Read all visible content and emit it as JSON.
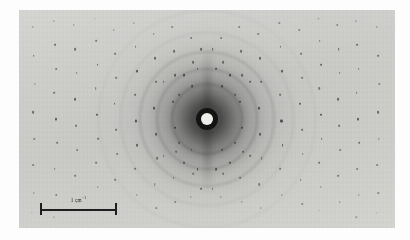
{
  "figure": {
    "kind": "x-ray-fiber-diffraction-photograph",
    "caption": "",
    "plate": {
      "x": 19,
      "y": 10,
      "width": 376,
      "height": 218
    },
    "page_background": "#fdfdfd",
    "emulsion_background": "#e3e3e1",
    "spot_color": "#2a2a2a",
    "halo_color": "#191919"
  },
  "beamstop": {
    "label": "beamstop",
    "center_x_pct": 50,
    "center_y_pct": 50,
    "disc_color": "#efefe9",
    "shadow_color": "#141414",
    "disc_diameter_px": 12,
    "shadow_diameter_px": 22
  },
  "scale_bar": {
    "label_text": "1 cm",
    "label_exponent": "−1",
    "x": 40,
    "y": 203,
    "length_px": 77,
    "color": "#1e1e1e",
    "tick_height_px": 12
  },
  "rings": [
    {
      "r": 34,
      "opacity": 0.26,
      "width": 2.4
    },
    {
      "r": 49,
      "opacity": 0.2,
      "width": 2.2
    },
    {
      "r": 66,
      "opacity": 0.15,
      "width": 2.0
    },
    {
      "r": 86,
      "opacity": 0.11,
      "width": 1.8
    },
    {
      "r": 108,
      "opacity": 0.08,
      "width": 1.6
    }
  ],
  "chart_data": {
    "type": "scatter",
    "title": "",
    "xlabel": "",
    "ylabel": "",
    "layer_line_columns_x_pct": [
      4,
      9.5,
      15,
      20.5,
      25.5,
      31,
      36,
      41,
      46,
      54,
      59,
      64,
      69.5,
      75,
      80,
      85,
      90,
      95.5
    ],
    "series": [
      {
        "name": "bragg-reflections",
        "note": "x,y in percent of plate; s = spot size in px; o = optical density 0-1",
        "points": [
          [
            3.6,
            8,
            1.5,
            0.45
          ],
          [
            3.9,
            21,
            1.7,
            0.55
          ],
          [
            4.2,
            34,
            1.4,
            0.4
          ],
          [
            3.8,
            47,
            1.8,
            0.6
          ],
          [
            4.1,
            59,
            1.5,
            0.48
          ],
          [
            3.7,
            71,
            1.6,
            0.5
          ],
          [
            4.0,
            84,
            1.4,
            0.42
          ],
          [
            3.5,
            93,
            1.3,
            0.35
          ],
          [
            9.2,
            5,
            1.4,
            0.38
          ],
          [
            9.6,
            16,
            1.9,
            0.62
          ],
          [
            9.9,
            27,
            1.6,
            0.52
          ],
          [
            9.4,
            38,
            1.7,
            0.55
          ],
          [
            9.8,
            50,
            2.0,
            0.68
          ],
          [
            10.1,
            61,
            1.7,
            0.54
          ],
          [
            9.5,
            73,
            1.6,
            0.5
          ],
          [
            9.9,
            85,
            1.5,
            0.44
          ],
          [
            9.3,
            95,
            1.3,
            0.34
          ],
          [
            14.6,
            7,
            1.5,
            0.42
          ],
          [
            15.0,
            18,
            1.8,
            0.58
          ],
          [
            15.3,
            29,
            1.6,
            0.5
          ],
          [
            14.8,
            41,
            1.9,
            0.64
          ],
          [
            15.2,
            53,
            1.8,
            0.6
          ],
          [
            15.5,
            64,
            1.6,
            0.48
          ],
          [
            14.9,
            76,
            1.7,
            0.53
          ],
          [
            15.3,
            88,
            1.4,
            0.4
          ],
          [
            20.2,
            4,
            1.3,
            0.34
          ],
          [
            20.6,
            14,
            1.7,
            0.52
          ],
          [
            20.9,
            25,
            1.9,
            0.63
          ],
          [
            20.4,
            36,
            1.6,
            0.5
          ],
          [
            20.8,
            48,
            2.0,
            0.7
          ],
          [
            21.1,
            59,
            1.8,
            0.58
          ],
          [
            20.5,
            70,
            1.7,
            0.53
          ],
          [
            20.9,
            81,
            1.5,
            0.44
          ],
          [
            20.3,
            92,
            1.4,
            0.38
          ],
          [
            25.2,
            9,
            1.5,
            0.44
          ],
          [
            25.6,
            20,
            1.8,
            0.58
          ],
          [
            25.9,
            31,
            1.7,
            0.54
          ],
          [
            25.4,
            43,
            1.9,
            0.65
          ],
          [
            25.8,
            55,
            1.8,
            0.6
          ],
          [
            26.1,
            66,
            1.6,
            0.49
          ],
          [
            25.5,
            78,
            1.7,
            0.52
          ],
          [
            25.9,
            89,
            1.4,
            0.4
          ],
          [
            30.6,
            6,
            1.4,
            0.38
          ],
          [
            31.0,
            17,
            1.8,
            0.57
          ],
          [
            31.3,
            28,
            2.0,
            0.68
          ],
          [
            30.8,
            39,
            1.8,
            0.6
          ],
          [
            31.2,
            51,
            2.1,
            0.74
          ],
          [
            31.5,
            62,
            1.9,
            0.63
          ],
          [
            30.9,
            73,
            1.7,
            0.52
          ],
          [
            31.3,
            85,
            1.5,
            0.44
          ],
          [
            35.8,
            11,
            1.6,
            0.48
          ],
          [
            36.2,
            22,
            1.9,
            0.62
          ],
          [
            36.5,
            33,
            1.8,
            0.58
          ],
          [
            36.0,
            45,
            2.0,
            0.7
          ],
          [
            36.4,
            57,
            1.9,
            0.64
          ],
          [
            36.7,
            68,
            1.7,
            0.52
          ],
          [
            36.1,
            80,
            1.6,
            0.48
          ],
          [
            36.5,
            91,
            1.4,
            0.38
          ],
          [
            40.8,
            8,
            1.5,
            0.44
          ],
          [
            41.2,
            19,
            1.8,
            0.58
          ],
          [
            41.5,
            30,
            1.9,
            0.63
          ],
          [
            41.0,
            42,
            2.0,
            0.7
          ],
          [
            41.4,
            54,
            2.0,
            0.7
          ],
          [
            41.7,
            65,
            1.8,
            0.58
          ],
          [
            41.1,
            77,
            1.7,
            0.52
          ],
          [
            41.5,
            88,
            1.5,
            0.42
          ],
          [
            45.8,
            13,
            1.6,
            0.48
          ],
          [
            46.2,
            24,
            1.8,
            0.58
          ],
          [
            46.0,
            35,
            1.9,
            0.62
          ],
          [
            45.9,
            64,
            1.9,
            0.62
          ],
          [
            46.3,
            75,
            1.7,
            0.52
          ],
          [
            45.7,
            86,
            1.5,
            0.42
          ],
          [
            53.8,
            13,
            1.6,
            0.48
          ],
          [
            54.2,
            24,
            1.8,
            0.58
          ],
          [
            54.0,
            35,
            1.9,
            0.62
          ],
          [
            53.9,
            64,
            1.9,
            0.62
          ],
          [
            54.3,
            75,
            1.7,
            0.52
          ],
          [
            53.7,
            86,
            1.5,
            0.42
          ],
          [
            58.6,
            8,
            1.5,
            0.44
          ],
          [
            59.0,
            19,
            1.8,
            0.58
          ],
          [
            59.3,
            30,
            1.9,
            0.63
          ],
          [
            58.8,
            42,
            2.0,
            0.7
          ],
          [
            59.2,
            54,
            2.0,
            0.7
          ],
          [
            59.5,
            65,
            1.8,
            0.58
          ],
          [
            58.9,
            77,
            1.7,
            0.52
          ],
          [
            59.3,
            88,
            1.5,
            0.42
          ],
          [
            63.6,
            11,
            1.6,
            0.48
          ],
          [
            64.0,
            22,
            1.9,
            0.62
          ],
          [
            64.3,
            33,
            1.8,
            0.58
          ],
          [
            63.8,
            45,
            2.0,
            0.7
          ],
          [
            64.2,
            57,
            1.9,
            0.64
          ],
          [
            64.5,
            68,
            1.7,
            0.52
          ],
          [
            63.9,
            80,
            1.6,
            0.48
          ],
          [
            64.3,
            91,
            1.4,
            0.38
          ],
          [
            69.2,
            6,
            1.4,
            0.38
          ],
          [
            69.6,
            17,
            1.8,
            0.57
          ],
          [
            69.9,
            28,
            2.0,
            0.68
          ],
          [
            69.4,
            39,
            1.8,
            0.6
          ],
          [
            69.8,
            51,
            2.1,
            0.74
          ],
          [
            70.1,
            62,
            1.9,
            0.63
          ],
          [
            69.5,
            73,
            1.7,
            0.52
          ],
          [
            69.9,
            85,
            1.5,
            0.44
          ],
          [
            74.6,
            9,
            1.5,
            0.44
          ],
          [
            75.0,
            20,
            1.8,
            0.58
          ],
          [
            75.3,
            31,
            1.7,
            0.54
          ],
          [
            74.8,
            43,
            1.9,
            0.65
          ],
          [
            75.2,
            55,
            1.8,
            0.6
          ],
          [
            75.5,
            66,
            1.6,
            0.49
          ],
          [
            74.9,
            78,
            1.7,
            0.52
          ],
          [
            75.3,
            89,
            1.4,
            0.4
          ],
          [
            79.6,
            4,
            1.3,
            0.34
          ],
          [
            80.0,
            14,
            1.7,
            0.52
          ],
          [
            80.3,
            25,
            1.9,
            0.63
          ],
          [
            79.8,
            36,
            1.6,
            0.5
          ],
          [
            80.2,
            48,
            2.0,
            0.7
          ],
          [
            80.5,
            59,
            1.8,
            0.58
          ],
          [
            79.9,
            70,
            1.7,
            0.53
          ],
          [
            80.3,
            81,
            1.5,
            0.44
          ],
          [
            79.7,
            92,
            1.4,
            0.38
          ],
          [
            84.6,
            7,
            1.5,
            0.42
          ],
          [
            85.0,
            18,
            1.8,
            0.58
          ],
          [
            85.3,
            29,
            1.6,
            0.5
          ],
          [
            84.8,
            41,
            1.9,
            0.64
          ],
          [
            85.2,
            53,
            1.8,
            0.6
          ],
          [
            85.5,
            64,
            1.6,
            0.48
          ],
          [
            84.9,
            76,
            1.7,
            0.53
          ],
          [
            85.3,
            88,
            1.4,
            0.4
          ],
          [
            89.6,
            5,
            1.4,
            0.38
          ],
          [
            90.0,
            16,
            1.9,
            0.62
          ],
          [
            90.3,
            27,
            1.6,
            0.52
          ],
          [
            89.8,
            38,
            1.7,
            0.55
          ],
          [
            90.2,
            50,
            2.0,
            0.68
          ],
          [
            90.5,
            61,
            1.7,
            0.54
          ],
          [
            89.9,
            73,
            1.6,
            0.5
          ],
          [
            90.3,
            85,
            1.5,
            0.44
          ],
          [
            89.7,
            95,
            1.3,
            0.34
          ],
          [
            95.2,
            8,
            1.5,
            0.45
          ],
          [
            95.5,
            21,
            1.7,
            0.55
          ],
          [
            95.8,
            34,
            1.4,
            0.4
          ],
          [
            95.4,
            47,
            1.8,
            0.6
          ],
          [
            95.7,
            59,
            1.5,
            0.48
          ],
          [
            95.3,
            71,
            1.6,
            0.5
          ],
          [
            95.6,
            84,
            1.4,
            0.42
          ],
          [
            95.1,
            93,
            1.3,
            0.35
          ],
          [
            44.0,
            30,
            2.0,
            0.72
          ],
          [
            47.5,
            27,
            1.9,
            0.68
          ],
          [
            52.5,
            27,
            1.9,
            0.68
          ],
          [
            56.0,
            30,
            2.0,
            0.72
          ],
          [
            42.5,
            39,
            1.8,
            0.62
          ],
          [
            57.5,
            39,
            1.8,
            0.62
          ],
          [
            42.5,
            61,
            1.8,
            0.62
          ],
          [
            57.5,
            61,
            1.8,
            0.62
          ],
          [
            44.0,
            70,
            2.0,
            0.72
          ],
          [
            47.5,
            73,
            1.9,
            0.68
          ],
          [
            52.5,
            73,
            1.9,
            0.68
          ],
          [
            56.0,
            70,
            2.0,
            0.72
          ],
          [
            38.5,
            33,
            1.7,
            0.58
          ],
          [
            61.5,
            33,
            1.7,
            0.58
          ],
          [
            38.5,
            67,
            1.7,
            0.58
          ],
          [
            61.5,
            67,
            1.7,
            0.58
          ],
          [
            48.5,
            18,
            1.8,
            0.6
          ],
          [
            51.5,
            18,
            1.8,
            0.6
          ],
          [
            48.5,
            82,
            1.8,
            0.6
          ],
          [
            51.5,
            82,
            1.8,
            0.6
          ]
        ]
      }
    ]
  }
}
